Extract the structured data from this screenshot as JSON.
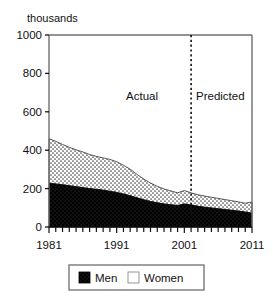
{
  "chart_data": {
    "type": "area",
    "title": "",
    "subtitle": "",
    "xlabel": "",
    "ylabel": "thousands",
    "ylim": [
      0,
      1000
    ],
    "xlim": [
      1981,
      2011
    ],
    "grid": false,
    "stacked": true,
    "legend_position": "bottom",
    "y_ticks": [
      "0",
      "200",
      "400",
      "600",
      "800",
      "1000"
    ],
    "y_tick_values": [
      0,
      200,
      400,
      600,
      800,
      1000
    ],
    "x_ticks": [
      "1981",
      "1991",
      "2001",
      "2011"
    ],
    "x_tick_values": [
      1981,
      1991,
      2001,
      2011
    ],
    "x_minor_tick_step": 1,
    "x": [
      1981,
      1982,
      1983,
      1984,
      1985,
      1986,
      1987,
      1988,
      1989,
      1990,
      1991,
      1992,
      1993,
      1994,
      1995,
      1996,
      1997,
      1998,
      1999,
      2000,
      2001,
      2002,
      2003,
      2004,
      2005,
      2006,
      2007,
      2008,
      2009,
      2010,
      2011
    ],
    "series": [
      {
        "name": "Men",
        "color": "#000000",
        "pattern": "solid-black",
        "values": [
          228,
          224,
          220,
          215,
          210,
          205,
          200,
          196,
          192,
          186,
          180,
          172,
          163,
          152,
          142,
          133,
          126,
          120,
          116,
          112,
          120,
          114,
          108,
          103,
          99,
          95,
          91,
          87,
          83,
          78,
          72
        ]
      },
      {
        "name": "Women",
        "color": "#f2f2f2",
        "pattern": "dotted-stipple",
        "values": [
          232,
          222,
          210,
          200,
          192,
          186,
          178,
          172,
          168,
          166,
          160,
          150,
          138,
          122,
          108,
          96,
          86,
          78,
          72,
          66,
          70,
          64,
          60,
          58,
          56,
          54,
          52,
          50,
          48,
          46,
          58
        ]
      }
    ],
    "totals": [
      460,
      446,
      430,
      415,
      402,
      391,
      378,
      368,
      360,
      352,
      340,
      322,
      301,
      274,
      250,
      229,
      212,
      198,
      188,
      178,
      190,
      178,
      168,
      161,
      155,
      149,
      143,
      137,
      131,
      124,
      130
    ],
    "annotations": [
      {
        "name": "actual",
        "text": "Actual",
        "x_px": 158,
        "y_px": 100,
        "anchor": "end"
      },
      {
        "name": "predicted",
        "text": "Predicted",
        "x_px": 196,
        "y_px": 100,
        "anchor": "start"
      }
    ],
    "divider": {
      "name": "forecast-divider",
      "style": "dotted",
      "x_value": 2002
    }
  },
  "legend": {
    "items": [
      {
        "label": "Men",
        "swatch": "#000000"
      },
      {
        "label": "Women",
        "swatch": "#ffffff"
      }
    ]
  }
}
